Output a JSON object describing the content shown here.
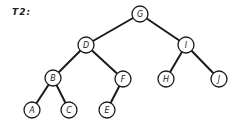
{
  "title": "T2:",
  "colors": {
    "stroke": "#1a1a1a",
    "background": "#ffffff"
  },
  "tree": {
    "root": "G",
    "node_radius": 8,
    "nodes": [
      {
        "id": "G",
        "label": "G",
        "x": 140,
        "y": 14
      },
      {
        "id": "D",
        "label": "D",
        "x": 86,
        "y": 45
      },
      {
        "id": "I",
        "label": "I",
        "x": 186,
        "y": 45
      },
      {
        "id": "B",
        "label": "B",
        "x": 53,
        "y": 78
      },
      {
        "id": "F",
        "label": "F",
        "x": 123,
        "y": 79
      },
      {
        "id": "H",
        "label": "H",
        "x": 166,
        "y": 79
      },
      {
        "id": "J",
        "label": "J",
        "x": 219,
        "y": 79
      },
      {
        "id": "A",
        "label": "A",
        "x": 32,
        "y": 110
      },
      {
        "id": "C",
        "label": "C",
        "x": 69,
        "y": 110
      },
      {
        "id": "E",
        "label": "E",
        "x": 107,
        "y": 110
      }
    ],
    "edges": [
      [
        "G",
        "D"
      ],
      [
        "G",
        "I"
      ],
      [
        "D",
        "B"
      ],
      [
        "D",
        "F"
      ],
      [
        "I",
        "H"
      ],
      [
        "I",
        "J"
      ],
      [
        "B",
        "A"
      ],
      [
        "B",
        "C"
      ],
      [
        "F",
        "E"
      ]
    ]
  }
}
